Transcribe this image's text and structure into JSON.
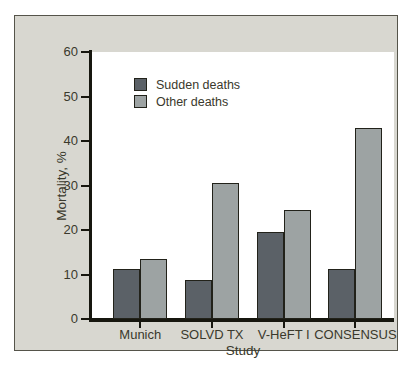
{
  "chart_data": {
    "type": "bar",
    "title": "",
    "categories": [
      "Munich",
      "SOLVD TX",
      "V-HeFT I",
      "CONSENSUS"
    ],
    "series": [
      {
        "name": "Sudden deaths",
        "color": "#5b6167",
        "values": [
          11.3,
          8.8,
          19.5,
          11.3
        ]
      },
      {
        "name": "Other deaths",
        "color": "#9da3a3",
        "values": [
          13.5,
          30.5,
          24.5,
          43.0
        ]
      }
    ],
    "xlabel": "Study",
    "ylabel": "Mortality, %",
    "ylim": [
      0,
      60
    ],
    "yticks": [
      0,
      10,
      20,
      30,
      40,
      50,
      60
    ],
    "grid": false,
    "legend_position": "upper-left-inside",
    "panel_background": "#d8d7d0",
    "plot_background": "#ffffff",
    "axis_color": "#17170f",
    "text_color": "#3a392c"
  }
}
